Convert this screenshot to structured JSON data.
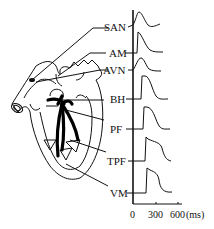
{
  "figure": {
    "labels": [
      {
        "id": "SAN",
        "text": "SAN"
      },
      {
        "id": "AM",
        "text": "AM"
      },
      {
        "id": "AVN",
        "text": "AVN"
      },
      {
        "id": "BH",
        "text": "BH"
      },
      {
        "id": "PF",
        "text": "PF"
      },
      {
        "id": "TPF",
        "text": "TPF"
      },
      {
        "id": "VM",
        "text": "VM"
      }
    ],
    "axis": {
      "ticks": [
        "0",
        "300",
        "600"
      ],
      "unit": "(ms)"
    }
  }
}
